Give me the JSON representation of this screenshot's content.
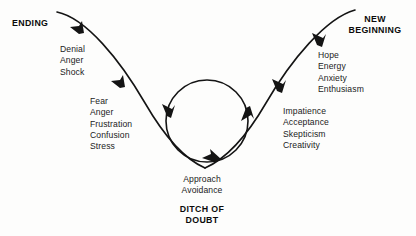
{
  "diagram": {
    "title_left": "ENDING",
    "title_right_line1": "NEW",
    "title_right_line2": "BEGINNING",
    "bottom_title_line1": "DITCH OF",
    "bottom_title_line2": "DOUBT",
    "stage_descent_upper": [
      "Denial",
      "Anger",
      "Shock"
    ],
    "stage_descent_lower": [
      "Fear",
      "Anger",
      "Frustration",
      "Confusion",
      "Stress"
    ],
    "stage_bottom": [
      "Approach",
      "Avoidance"
    ],
    "stage_ascent_lower": [
      "Impatience",
      "Acceptance",
      "Skepticism",
      "Creativity"
    ],
    "stage_ascent_upper": [
      "Hope",
      "Energy",
      "Anxiety",
      "Enthusiasm"
    ],
    "colors": {
      "ink": "#141414",
      "background": "#fdfdfc"
    },
    "icons": {
      "curve": "transition-curve",
      "loop": "doubt-loop-circle",
      "arrow": "arrowhead"
    }
  }
}
